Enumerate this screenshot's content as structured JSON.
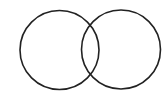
{
  "diagram": {
    "type": "venn",
    "width": 168,
    "height": 97,
    "background": "#ffffff",
    "stroke_color": "#222222",
    "stroke_width": 1.6,
    "sets": [
      {
        "id": "left",
        "cx": 59.5,
        "cy": 50,
        "r": 39.5,
        "label": ""
      },
      {
        "id": "right",
        "cx": 121,
        "cy": 49.5,
        "r": 39.5,
        "label": ""
      }
    ]
  }
}
